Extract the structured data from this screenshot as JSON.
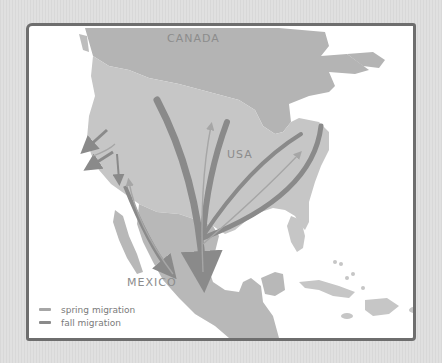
{
  "map": {
    "labels": {
      "canada": "CANADA",
      "usa": "USA",
      "mexico": "MEXICO"
    },
    "colors": {
      "background": "#dcdcdc",
      "frame": "#6e6e6e",
      "water": "#ffffff",
      "canada_land": "#b4b4b4",
      "usa_land": "#c6c6c6",
      "mexico_land": "#b8b8b8",
      "spring_arrow": "#a6a6a6",
      "fall_arrow": "#8a8a8a"
    }
  },
  "legend": {
    "items": [
      {
        "label": "spring migration",
        "color": "#a6a6a6"
      },
      {
        "label": "fall migration",
        "color": "#8a8a8a"
      }
    ]
  }
}
